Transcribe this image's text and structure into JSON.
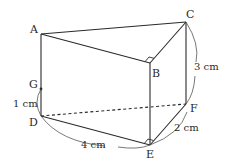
{
  "diagram": {
    "type": "triangular-prism",
    "vertices": {
      "A": {
        "label": "A",
        "x": 41,
        "y": 34
      },
      "B": {
        "label": "B",
        "x": 150,
        "y": 63
      },
      "C": {
        "label": "C",
        "x": 186,
        "y": 22
      },
      "D": {
        "label": "D",
        "x": 41,
        "y": 116
      },
      "E": {
        "label": "E",
        "x": 150,
        "y": 145
      },
      "F": {
        "label": "F",
        "x": 186,
        "y": 104
      },
      "G": {
        "label": "G",
        "x": 41,
        "y": 89
      }
    },
    "edges": [
      {
        "from": "A",
        "to": "B",
        "style": "solid"
      },
      {
        "from": "B",
        "to": "C",
        "style": "solid"
      },
      {
        "from": "A",
        "to": "C",
        "style": "solid"
      },
      {
        "from": "A",
        "to": "D",
        "style": "solid"
      },
      {
        "from": "B",
        "to": "E",
        "style": "solid"
      },
      {
        "from": "C",
        "to": "F",
        "style": "solid"
      },
      {
        "from": "D",
        "to": "E",
        "style": "solid"
      },
      {
        "from": "E",
        "to": "F",
        "style": "solid"
      },
      {
        "from": "D",
        "to": "F",
        "style": "dashed"
      }
    ],
    "right_angles": [
      "B",
      "E"
    ],
    "dimensions": {
      "DG": "1 cm",
      "DE": "4 cm",
      "EF": "2 cm",
      "CF": "3 cm"
    },
    "colors": {
      "stroke": "#2a2a2a",
      "background": "#ffffff"
    }
  }
}
